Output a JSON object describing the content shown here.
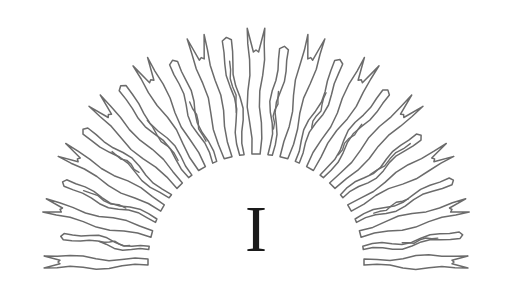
{
  "page": {
    "width": 512,
    "height": 284,
    "background_color": "#ffffff",
    "kind": "decorative-ornament"
  },
  "ornament": {
    "name": "sunburst-rays-semicircle",
    "description": "Hand-drawn semicircular sunburst of alternating wide notched spikes and thin wavy double-line rays",
    "stroke_color": "#6b6b6b",
    "stroke_width": 1.5,
    "fill": "none",
    "center_x": 256,
    "center_y": 262,
    "inner_radius": 108,
    "outer_radius_top": 234,
    "outer_radius_side": 212,
    "ray_count": 25,
    "angle_start_deg": 180,
    "angle_end_deg": 0,
    "symmetry": "mirror-vertical"
  },
  "numeral": {
    "text": "I",
    "color": "#1a1a1a",
    "role": "chapter-number"
  }
}
